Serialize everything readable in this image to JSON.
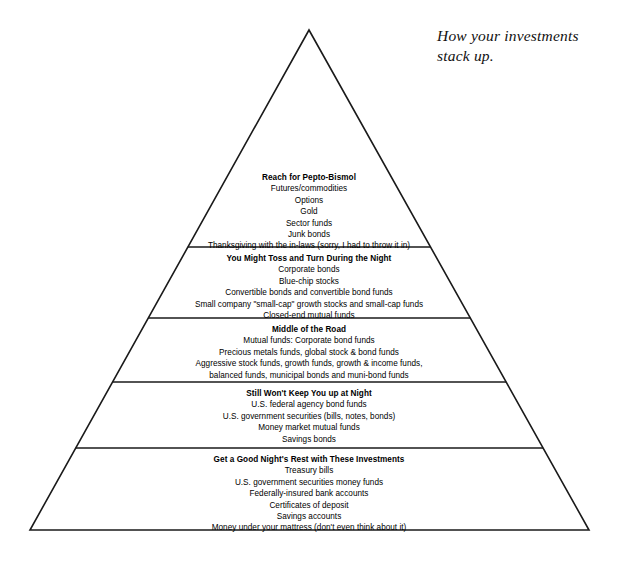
{
  "caption": {
    "line1": "How your investments",
    "line2": "stack up."
  },
  "diagram": {
    "type": "pyramid",
    "name": "investment-risk-pyramid",
    "stroke_color": "#1a1a1a",
    "fill_color": "#ffffff",
    "apex": {
      "x": 309,
      "y": 30
    },
    "base_left": {
      "x": 30,
      "y": 530
    },
    "base_right": {
      "x": 589,
      "y": 530
    },
    "divider_y": [
      247,
      318,
      382,
      448
    ],
    "tiers": [
      {
        "id": "reach-for-pepto-bismol",
        "title": "Reach for Pepto-Bismol",
        "items": [
          "Futures/commodities",
          "Options",
          "Gold",
          "Sector funds",
          "Junk bonds",
          "Thanksgiving with the in-laws (sorry, I had to throw it in)"
        ]
      },
      {
        "id": "you-might-toss-and-turn-during-the-night",
        "title": "You Might Toss and Turn During the Night",
        "items": [
          "Corporate bonds",
          "Blue-chip stocks",
          "Convertible bonds and convertible bond funds",
          "Small company \"small-cap\" growth stocks and small-cap funds",
          "Closed-end mutual funds"
        ]
      },
      {
        "id": "middle-of-the-road",
        "title": "Middle of the Road",
        "items": [
          "Mutual funds: Corporate bond funds",
          "Precious metals funds, global stock & bond funds",
          "Aggressive stock funds, growth funds, growth & income funds,",
          "balanced funds, municipal bonds and muni-bond funds"
        ]
      },
      {
        "id": "still-wont-keep-you-up-at-night",
        "title": "Still Won't Keep You up at Night",
        "items": [
          "U.S. federal agency bond funds",
          "U.S. government securities (bills, notes, bonds)",
          "Money market mutual funds",
          "Savings bonds"
        ]
      },
      {
        "id": "get-a-good-nights-rest-with-these-investments",
        "title": "Get a Good Night's Rest with These Investments",
        "items": [
          "Treasury bills",
          "U.S. government securities money funds",
          "Federally-insured bank accounts",
          "Certificates of deposit",
          "Savings accounts",
          "Money under your mattress (don't even think about it)"
        ]
      }
    ]
  }
}
